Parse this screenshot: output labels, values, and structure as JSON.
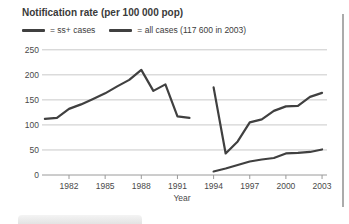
{
  "chart_data": {
    "type": "line",
    "title": "Notification rate (per 100 000 pop)",
    "xlabel": "Year",
    "legend": [
      {
        "label": "= ss+ cases"
      },
      {
        "label": "= all cases (117 600 in 2003)"
      }
    ],
    "legend_position": "top",
    "grid": true,
    "ylim": [
      0,
      250
    ],
    "xlim": [
      1979.5,
      2003.5
    ],
    "yticks": [
      0,
      50,
      100,
      150,
      200,
      250
    ],
    "xticks": [
      1982,
      1985,
      1988,
      1991,
      1994,
      1997,
      2000,
      2003
    ],
    "line_color": "#404040",
    "grid_color": "#c9c9c9",
    "axis_color": "#9a9a9a",
    "tick_text_color": "#4a4a4a",
    "series": [
      {
        "name": "all cases 1980-1992",
        "x": [
          1980,
          1981,
          1982,
          1983,
          1984,
          1985,
          1986,
          1987,
          1988,
          1989,
          1990,
          1991,
          1992
        ],
        "values": [
          112,
          114,
          132,
          141,
          152,
          163,
          177,
          190,
          210,
          168,
          181,
          117,
          114
        ]
      },
      {
        "name": "all cases 1994-2003",
        "x": [
          1994,
          1995,
          1996,
          1997,
          1998,
          1999,
          2000,
          2001,
          2002,
          2003
        ],
        "values": [
          175,
          43,
          67,
          105,
          111,
          128,
          137,
          138,
          156,
          164
        ]
      },
      {
        "name": "ss+ cases 1994-2003",
        "x": [
          1994,
          1995,
          1996,
          1997,
          1998,
          1999,
          2000,
          2001,
          2002,
          2003
        ],
        "values": [
          7,
          13,
          20,
          27,
          31,
          34,
          43,
          44,
          46,
          51
        ]
      }
    ]
  }
}
